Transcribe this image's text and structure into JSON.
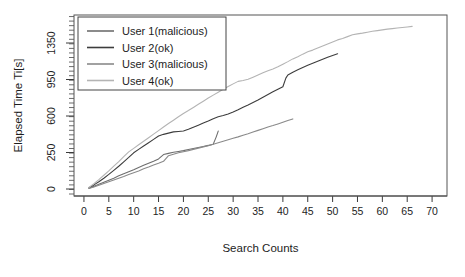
{
  "chart_data": {
    "type": "line",
    "title": "",
    "xlabel": "Search Counts",
    "ylabel": "Elapsed Time Ti[s]",
    "xlim": [
      -2,
      73
    ],
    "ylim": [
      0,
      1560
    ],
    "grid": false,
    "legend_position": "top-left",
    "xticks": [
      0,
      5,
      10,
      15,
      20,
      25,
      30,
      35,
      40,
      45,
      50,
      55,
      60,
      65,
      70
    ],
    "xticklabels": [
      "0",
      "5",
      "10",
      "15",
      "20",
      "25",
      "30",
      "35",
      "40",
      "45",
      "50",
      "55",
      "60",
      "65",
      "70"
    ],
    "yticks": [
      0,
      250,
      600,
      950,
      1350
    ],
    "yticklabels": [
      "0",
      "250",
      "600",
      "950",
      "1350"
    ],
    "series": [
      {
        "name": "User 1(malicious)",
        "color": "#6e6e6e",
        "x": [
          1,
          2,
          3,
          4,
          5,
          6,
          7,
          8,
          9,
          10,
          11,
          12,
          13,
          14,
          15,
          16,
          17,
          18,
          19,
          20,
          21,
          22,
          23,
          24,
          25,
          26,
          26.6,
          27
        ],
        "y": [
          5,
          18,
          32,
          46,
          60,
          74,
          90,
          104,
          118,
          132,
          148,
          162,
          176,
          190,
          206,
          236,
          244,
          252,
          260,
          268,
          278,
          288,
          298,
          308,
          318,
          330,
          400,
          455
        ]
      },
      {
        "name": "User 2(ok)",
        "color": "#3d3d3d",
        "x": [
          1,
          2,
          3,
          4,
          5,
          6,
          7,
          8,
          9,
          10,
          11,
          12,
          13,
          14,
          15,
          16,
          17,
          18,
          19,
          20,
          21,
          22,
          23,
          24,
          25,
          26,
          27,
          28,
          29,
          30,
          31,
          32,
          33,
          34,
          35,
          36,
          37,
          38,
          39,
          40,
          40.6,
          41,
          42,
          43,
          44,
          45,
          46,
          47,
          48,
          49,
          50,
          51
        ],
        "y": [
          8,
          28,
          50,
          74,
          100,
          128,
          156,
          186,
          216,
          248,
          280,
          312,
          344,
          376,
          408,
          424,
          436,
          448,
          452,
          456,
          472,
          492,
          512,
          532,
          552,
          574,
          592,
          604,
          620,
          638,
          660,
          684,
          706,
          730,
          754,
          780,
          806,
          832,
          856,
          880,
          965,
          1000,
          1030,
          1056,
          1082,
          1106,
          1128,
          1150,
          1172,
          1194,
          1214,
          1232
        ]
      },
      {
        "name": "User 3(malicious)",
        "color": "#8a8a8a",
        "x": [
          1,
          2,
          3,
          4,
          5,
          6,
          7,
          8,
          9,
          10,
          11,
          12,
          13,
          14,
          15,
          16,
          17,
          18,
          19,
          20,
          21,
          22,
          23,
          24,
          25,
          26,
          27,
          28,
          29,
          30,
          31,
          32,
          33,
          34,
          35,
          36,
          37,
          38,
          39,
          40,
          41,
          42
        ],
        "y": [
          4,
          14,
          26,
          38,
          50,
          62,
          74,
          86,
          100,
          112,
          124,
          138,
          150,
          164,
          176,
          190,
          228,
          238,
          248,
          258,
          268,
          280,
          292,
          304,
          316,
          330,
          344,
          358,
          372,
          386,
          400,
          416,
          430,
          446,
          462,
          478,
          494,
          508,
          524,
          540,
          556,
          572
        ]
      },
      {
        "name": "User 4(ok)",
        "color": "#b4b4b4",
        "x": [
          1,
          2,
          3,
          4,
          5,
          6,
          7,
          8,
          9,
          10,
          11,
          12,
          13,
          14,
          15,
          16,
          17,
          18,
          19,
          20,
          21,
          22,
          23,
          24,
          25,
          26,
          27,
          28,
          29,
          30,
          31,
          32,
          33,
          34,
          35,
          36,
          37,
          38,
          39,
          40,
          41,
          42,
          43,
          44,
          45,
          46,
          47,
          48,
          49,
          50,
          51,
          52,
          53,
          54,
          55,
          56,
          57,
          58,
          59,
          60,
          61,
          62,
          63,
          64,
          65,
          66
        ],
        "y": [
          10,
          36,
          64,
          94,
          124,
          156,
          188,
          222,
          256,
          290,
          324,
          358,
          392,
          426,
          460,
          494,
          528,
          560,
          592,
          624,
          652,
          682,
          712,
          742,
          772,
          800,
          828,
          856,
          882,
          908,
          932,
          940,
          952,
          976,
          1000,
          1024,
          1046,
          1066,
          1090,
          1118,
          1146,
          1176,
          1200,
          1228,
          1254,
          1272,
          1296,
          1318,
          1340,
          1362,
          1384,
          1400,
          1420,
          1440,
          1450,
          1458,
          1468,
          1478,
          1486,
          1494,
          1502,
          1508,
          1514,
          1520,
          1526,
          1532
        ]
      }
    ]
  },
  "legend": {
    "entries": [
      {
        "label": "User 1(malicious)",
        "color": "#6e6e6e"
      },
      {
        "label": "User 2(ok)",
        "color": "#3d3d3d"
      },
      {
        "label": "User 3(malicious)",
        "color": "#8a8a8a"
      },
      {
        "label": "User 4(ok)",
        "color": "#b4b4b4"
      }
    ]
  }
}
